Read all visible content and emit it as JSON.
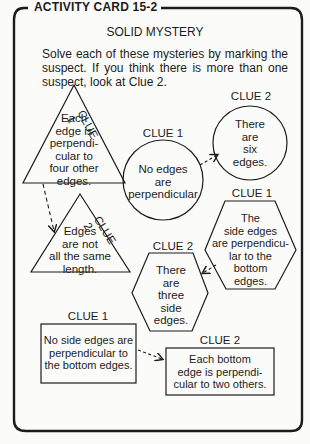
{
  "card": {
    "title": "ACTIVITY CARD 15-2",
    "subtitle": "SOLID MYSTERY",
    "instructions": "Solve each of these mysteries by marking the suspect. If you think there is more than one suspect, look at Clue 2."
  },
  "mysteries": [
    {
      "clue1": {
        "label": "CLUE 1",
        "shape": "triangle",
        "lines": [
          "Each",
          "edge is",
          "perpendi-",
          "cular to",
          "four other",
          "edges."
        ]
      },
      "clue2": {
        "label": "CLUE 2",
        "shape": "triangle",
        "lines": [
          "Edges",
          "are not",
          "all the same",
          "length."
        ]
      }
    },
    {
      "clue1": {
        "label": "CLUE 1",
        "shape": "circle",
        "lines": [
          "No edges",
          "are",
          "perpendicular"
        ]
      },
      "clue2": {
        "label": "CLUE 2",
        "shape": "circle",
        "lines": [
          "There",
          "are",
          "six",
          "edges."
        ]
      }
    },
    {
      "clue1": {
        "label": "CLUE 1",
        "shape": "hexagon",
        "lines": [
          "The",
          "side edges",
          "are perpendicu-",
          "lar to the",
          "bottom",
          "edges."
        ]
      },
      "clue2": {
        "label": "CLUE 2",
        "shape": "hexagon",
        "lines": [
          "There",
          "are",
          "three",
          "side",
          "edges."
        ]
      }
    },
    {
      "clue1": {
        "label": "CLUE 1",
        "shape": "rectangle",
        "lines": [
          "No side edges are",
          "perpendicular to",
          "the bottom edges."
        ]
      },
      "clue2": {
        "label": "CLUE 2",
        "shape": "rectangle",
        "lines": [
          "Each bottom",
          "edge is perpendi-",
          "cular to two others."
        ]
      }
    }
  ],
  "colors": {
    "ink": "#1c1c1c",
    "paper": "#fbfbf9"
  }
}
